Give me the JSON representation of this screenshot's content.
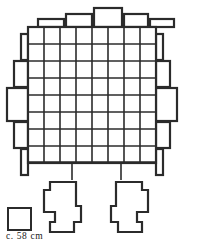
{
  "figure": {
    "type": "archaeological-plan-drawing",
    "background_color": "#ffffff",
    "line_color": "#2b2b2b",
    "grid": {
      "columns": 8,
      "rows": 8,
      "cell_width": 16,
      "cell_height": 17,
      "origin_x": 28,
      "origin_y": 27,
      "outer_stroke": 2.2,
      "inner_stroke": 1.6
    },
    "extra_dividers": {
      "vertical_x": [
        72,
        121
      ],
      "vertical_span": [
        162,
        180
      ],
      "horizontal_y": [
        162
      ],
      "horizontal_span": [
        28,
        156
      ]
    },
    "protrusions": {
      "top": [
        {
          "x": 38,
          "y": 19,
          "w": 26,
          "h": 8
        },
        {
          "x": 66,
          "y": 14,
          "w": 26,
          "h": 13
        },
        {
          "x": 94,
          "y": 8,
          "w": 28,
          "h": 19
        },
        {
          "x": 124,
          "y": 14,
          "w": 24,
          "h": 13
        },
        {
          "x": 150,
          "y": 19,
          "w": 24,
          "h": 8
        }
      ],
      "bottom": [],
      "left": [
        {
          "x": 21,
          "y": 34,
          "w": 7,
          "h": 26
        },
        {
          "x": 14,
          "y": 61,
          "w": 14,
          "h": 26
        },
        {
          "x": 7,
          "y": 88,
          "w": 21,
          "h": 33
        },
        {
          "x": 14,
          "y": 122,
          "w": 14,
          "h": 26
        },
        {
          "x": 21,
          "y": 149,
          "w": 7,
          "h": 26
        }
      ],
      "right": [
        {
          "x": 156,
          "y": 34,
          "w": 7,
          "h": 26
        },
        {
          "x": 156,
          "y": 61,
          "w": 14,
          "h": 26
        },
        {
          "x": 156,
          "y": 88,
          "w": 21,
          "h": 33
        },
        {
          "x": 156,
          "y": 122,
          "w": 14,
          "h": 26
        },
        {
          "x": 156,
          "y": 149,
          "w": 7,
          "h": 26
        }
      ]
    },
    "feet": [
      {
        "name": "left-foot",
        "points": "50,182 50,190 44,190 44,212 55,212 55,222 50,222 50,232 74,232 74,222 81,222 81,206 76,206 76,182"
      },
      {
        "name": "right-foot",
        "points": "116,182 116,206 111,206 111,222 118,222 118,232 142,232 142,222 137,222 137,212 148,212 148,190 142,190 142,182"
      }
    ],
    "scale_reference": {
      "box": {
        "x": 8,
        "y": 208,
        "w": 23,
        "h": 22
      },
      "label": "c. 58 cm"
    }
  }
}
